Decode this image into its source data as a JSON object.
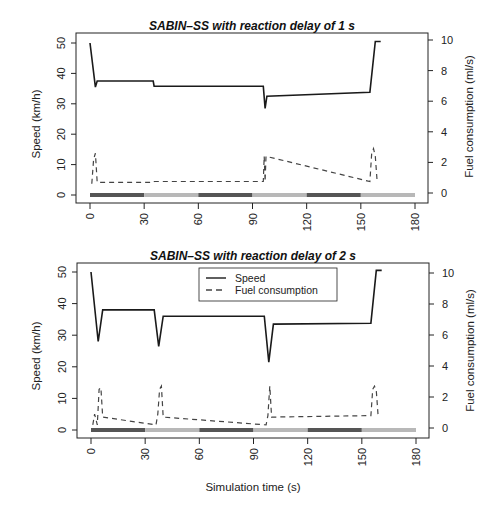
{
  "chart_data": [
    {
      "type": "line",
      "title": "SABIN–SS with reaction delay of 1 s",
      "xlabel": "",
      "ylabel": "Speed (km/h)",
      "y2label": "Fuel consumption (ml/s)",
      "xlim": [
        0,
        180
      ],
      "ylim": [
        0,
        50
      ],
      "y2lim": [
        0,
        10
      ],
      "xticks": [
        "0",
        "30",
        "60",
        "90",
        "120",
        "150",
        "180"
      ],
      "yticks": [
        "0",
        "10",
        "20",
        "30",
        "40",
        "50"
      ],
      "y2ticks": [
        "0",
        "2",
        "4",
        "6",
        "8",
        "10"
      ],
      "grid": false,
      "series": [
        {
          "name": "Speed",
          "axis": "left",
          "style": "solid",
          "x": [
            0,
            3,
            4,
            35,
            35.5,
            96,
            97,
            98,
            155,
            158,
            161
          ],
          "y": [
            50,
            35.5,
            37.5,
            37.5,
            35.8,
            35.8,
            28.5,
            32.5,
            33.8,
            50.5,
            50.5
          ]
        },
        {
          "name": "Fuel consumption",
          "axis": "right",
          "style": "dashed",
          "x": [
            1,
            2,
            3,
            4,
            35,
            35.5,
            96,
            96.5,
            97,
            97.5,
            155,
            156,
            157,
            158,
            159
          ],
          "y": [
            0.6,
            2.2,
            2.6,
            0.7,
            0.7,
            0.75,
            0.75,
            2.4,
            0.75,
            2.4,
            0.75,
            2.6,
            2.9,
            2.4,
            0.8
          ]
        }
      ],
      "signal_bar": {
        "description": "traffic light state strip at y=0",
        "segments": [
          {
            "from": 0,
            "to": 30,
            "shade": "dark"
          },
          {
            "from": 30,
            "to": 60,
            "shade": "light"
          },
          {
            "from": 60,
            "to": 90,
            "shade": "dark"
          },
          {
            "from": 90,
            "to": 120,
            "shade": "light"
          },
          {
            "from": 120,
            "to": 150,
            "shade": "dark"
          },
          {
            "from": 150,
            "to": 180,
            "shade": "light"
          }
        ]
      }
    },
    {
      "type": "line",
      "title": "SABIN–SS with reaction  delay of 2 s",
      "xlabel": "Simulation time (s)",
      "ylabel": "Speed (km/h)",
      "y2label": "Fuel consumption (ml/s)",
      "xlim": [
        0,
        180
      ],
      "ylim": [
        0,
        50
      ],
      "y2lim": [
        0,
        10
      ],
      "xticks": [
        "0",
        "30",
        "60",
        "90",
        "120",
        "150",
        "180"
      ],
      "yticks": [
        "0",
        "10",
        "20",
        "30",
        "40",
        "50"
      ],
      "y2ticks": [
        "0",
        "2",
        "4",
        "6",
        "8",
        "10"
      ],
      "grid": false,
      "legend": {
        "position": "top-center",
        "entries": [
          {
            "label": "Speed",
            "style": "solid"
          },
          {
            "label": "Fuel consumption",
            "style": "dashed"
          }
        ]
      },
      "series": [
        {
          "name": "Speed",
          "axis": "left",
          "style": "solid",
          "x": [
            0,
            4,
            6.5,
            35,
            37.5,
            40,
            96,
            98.5,
            101,
            155,
            158,
            161
          ],
          "y": [
            50,
            28,
            38,
            38,
            26.5,
            36,
            36,
            21.5,
            33.5,
            33.8,
            50.5,
            50.5
          ]
        },
        {
          "name": "Fuel consumption",
          "axis": "right",
          "style": "dashed",
          "x": [
            1,
            2,
            3.5,
            4.5,
            5.5,
            6.5,
            36,
            37,
            38,
            39,
            40,
            97,
            98,
            99,
            100,
            155,
            156,
            157,
            158,
            159
          ],
          "y": [
            0.2,
            0.9,
            0.2,
            2.5,
            2.6,
            0.7,
            0.2,
            0.9,
            2.5,
            2.7,
            0.7,
            0.2,
            0.8,
            2.7,
            0.7,
            0.8,
            2.5,
            2.7,
            2.4,
            0.8
          ]
        }
      ],
      "signal_bar": {
        "description": "traffic light state strip at y=0",
        "segments": [
          {
            "from": 0,
            "to": 30,
            "shade": "dark"
          },
          {
            "from": 30,
            "to": 60,
            "shade": "light"
          },
          {
            "from": 60,
            "to": 90,
            "shade": "dark"
          },
          {
            "from": 90,
            "to": 120,
            "shade": "light"
          },
          {
            "from": 120,
            "to": 150,
            "shade": "dark"
          },
          {
            "from": 150,
            "to": 180,
            "shade": "light"
          }
        ]
      }
    }
  ],
  "colors": {
    "line": "#1a1a1a",
    "dash": "#444444",
    "bar_dark": "#555555",
    "bar_light": "#b8b8b8",
    "axis": "#222222"
  }
}
